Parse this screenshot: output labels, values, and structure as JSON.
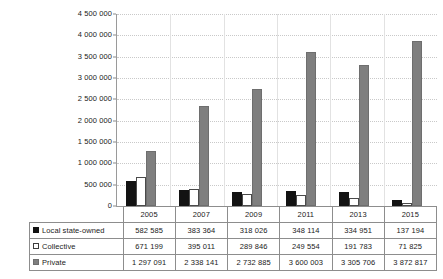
{
  "chart_data": {
    "type": "bar",
    "title": "",
    "subtitle": "",
    "xlabel": "",
    "ylabel": "",
    "categories": [
      "2005",
      "2007",
      "2009",
      "2011",
      "2013",
      "2015"
    ],
    "series": [
      {
        "name": "Local state-owned",
        "swatch": "black-filled-square",
        "color": "#131313",
        "values": [
          582585,
          383364,
          318026,
          348114,
          334951,
          137194
        ],
        "value_labels": [
          "582 585",
          "383 364",
          "318 026",
          "348 114",
          "334 951",
          "137 194"
        ]
      },
      {
        "name": "Collective",
        "swatch": "white-outlined-square",
        "color": "#ffffff",
        "values": [
          671199,
          395011,
          289846,
          249554,
          191783,
          71825
        ],
        "value_labels": [
          "671 199",
          "395 011",
          "289 846",
          "249 554",
          "191 783",
          "71 825"
        ]
      },
      {
        "name": "Private",
        "swatch": "gray-filled-square",
        "color": "#7f7f7f",
        "values": [
          1297091,
          2338141,
          2732885,
          3600003,
          3305706,
          3872817
        ],
        "value_labels": [
          "1 297 091",
          "2 338 141",
          "2 732 885",
          "3 600 003",
          "3 305 706",
          "3 872 817"
        ]
      }
    ],
    "ylim": [
      0,
      4500000
    ],
    "ytick_step": 500000,
    "ytick_values": [
      4500000,
      4000000,
      3500000,
      3000000,
      2500000,
      2000000,
      1500000,
      1000000,
      500000,
      0
    ],
    "ytick_labels": [
      "4 500 000",
      "4 000 000",
      "3 500 000",
      "3 000 000",
      "2 500 000",
      "2 000 000",
      "1 500 000",
      "1 000 000",
      "500 000",
      "0"
    ],
    "grid": true,
    "grid_style": "dotted-horizontal",
    "legend": "data-table-below",
    "legend_position": "bottom-table-first-column"
  },
  "table": {
    "corner_label": "",
    "column_headers": [
      "2005",
      "2007",
      "2009",
      "2011",
      "2013",
      "2015"
    ],
    "rows": [
      {
        "label": "Local state-owned",
        "swatch_class": "local",
        "cells": [
          "582 585",
          "383 364",
          "318 026",
          "348 114",
          "334 951",
          "137 194"
        ]
      },
      {
        "label": "Collective",
        "swatch_class": "collective",
        "cells": [
          "671 199",
          "395 011",
          "289 846",
          "249 554",
          "191 783",
          "71 825"
        ]
      },
      {
        "label": "Private",
        "swatch_class": "private",
        "cells": [
          "1 297 091",
          "2 338 141",
          "2 732 885",
          "3 600 003",
          "3 305 706",
          "3 872 817"
        ]
      }
    ]
  },
  "colors": {
    "local_state_owned": "#131313",
    "collective": "#ffffff",
    "collective_outline": "#4a4a4a",
    "private": "#7f7f7f",
    "gridline": "#c9c9c9",
    "axis": "#9a9a9a",
    "table_border": "#8d8d8d",
    "background": "#ffffff"
  }
}
